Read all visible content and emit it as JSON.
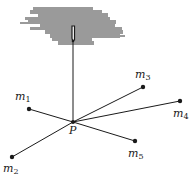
{
  "diagram": {
    "support": {
      "label": "",
      "color": "#9a9a9a"
    },
    "center": {
      "label": "P",
      "x": 73,
      "y": 122
    },
    "hook": {
      "x": 73,
      "y_top": 26,
      "y_bottom": 40
    },
    "masses": [
      {
        "name": "m1",
        "base": "m",
        "sub": "1",
        "x": 29,
        "y": 109,
        "lx": 15,
        "ly": 100
      },
      {
        "name": "m2",
        "base": "m",
        "sub": "2",
        "x": 12,
        "y": 157,
        "lx": 3,
        "ly": 172
      },
      {
        "name": "m3",
        "base": "m",
        "sub": "3",
        "x": 143,
        "y": 87,
        "lx": 135,
        "ly": 78
      },
      {
        "name": "m4",
        "base": "m",
        "sub": "4",
        "x": 180,
        "y": 101,
        "lx": 173,
        "ly": 117
      },
      {
        "name": "m5",
        "base": "m",
        "sub": "5",
        "x": 135,
        "y": 141,
        "lx": 128,
        "ly": 157
      }
    ],
    "line_color": "#1a1a1a"
  }
}
